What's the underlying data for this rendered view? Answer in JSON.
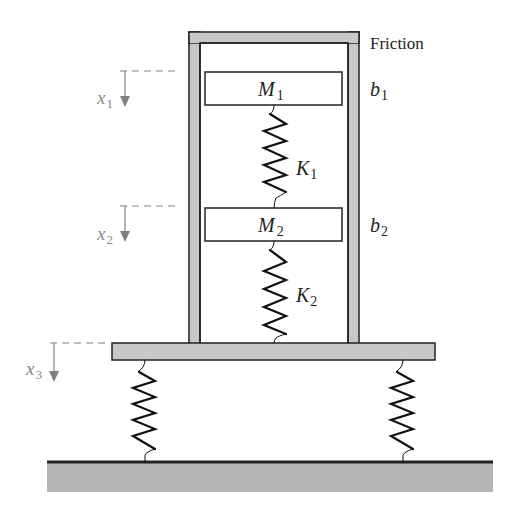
{
  "diagram": {
    "colors": {
      "stroke": "#222222",
      "fill_gray": "#c8c8c8",
      "ground_gray": "#b4b4b4",
      "dimension_gray": "#808080",
      "background": "#ffffff"
    },
    "labels": {
      "friction": "Friction",
      "m1": {
        "main": "M",
        "sub": "1"
      },
      "m2": {
        "main": "M",
        "sub": "2"
      },
      "k1": {
        "main": "K",
        "sub": "1"
      },
      "k2": {
        "main": "K",
        "sub": "2"
      },
      "b1": {
        "main": "b",
        "sub": "1"
      },
      "b2": {
        "main": "b",
        "sub": "2"
      },
      "x1": {
        "main": "x",
        "sub": "1"
      },
      "x2": {
        "main": "x",
        "sub": "2"
      },
      "x3": {
        "main": "x",
        "sub": "3"
      }
    },
    "components": [
      "outer-frame",
      "mass-m1",
      "spring-k1",
      "mass-m2",
      "spring-k2",
      "platform",
      "left-support-spring",
      "right-support-spring",
      "ground"
    ]
  }
}
